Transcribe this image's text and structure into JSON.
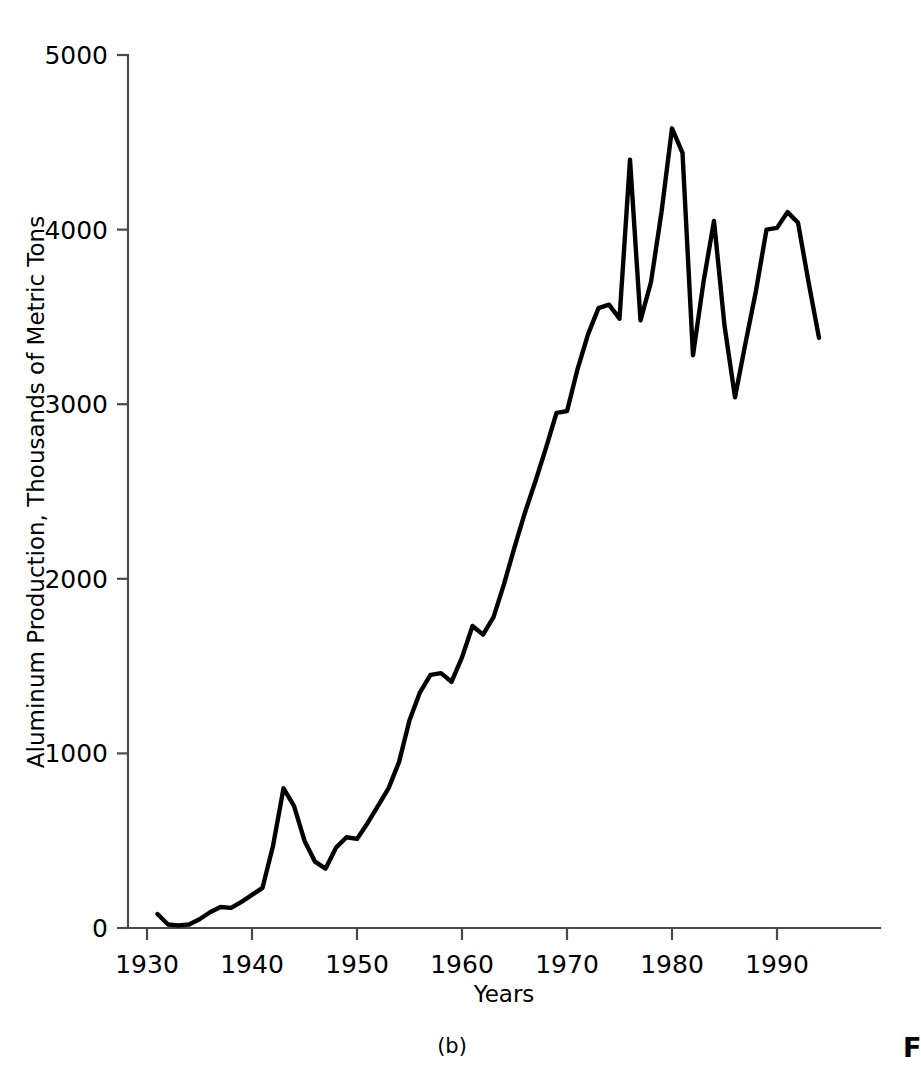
{
  "figure": {
    "panel_label": "(b)",
    "caption_partial": "F"
  },
  "chart_data": {
    "type": "line",
    "title": "",
    "xlabel": "Years",
    "ylabel": "Aluminum Production, Thousands of Metric Tons",
    "xlim": [
      1930,
      1999
    ],
    "ylim": [
      0,
      5000
    ],
    "xticks": [
      1930,
      1940,
      1950,
      1960,
      1970,
      1980,
      1990
    ],
    "xtick_labels": [
      "1930",
      "1940",
      "1950",
      "1960",
      "1970",
      "1980",
      "1990"
    ],
    "yticks": [
      0,
      1000,
      2000,
      3000,
      4000,
      5000
    ],
    "ytick_labels": [
      "0",
      "1000",
      "2000",
      "3000",
      "4000",
      "5000"
    ],
    "grid": false,
    "legend": null,
    "line_color": "#000000",
    "axis_color": "#4a4a4a",
    "series": [
      {
        "name": "Aluminum Production",
        "x": [
          1931,
          1932,
          1933,
          1934,
          1935,
          1936,
          1937,
          1938,
          1939,
          1940,
          1941,
          1942,
          1943,
          1944,
          1945,
          1946,
          1947,
          1948,
          1949,
          1950,
          1951,
          1952,
          1953,
          1954,
          1955,
          1956,
          1957,
          1958,
          1959,
          1960,
          1961,
          1962,
          1963,
          1964,
          1965,
          1966,
          1967,
          1968,
          1969,
          1970,
          1971,
          1972,
          1973,
          1974,
          1975,
          1976,
          1977,
          1978,
          1979,
          1980,
          1981,
          1982,
          1983,
          1984,
          1985,
          1986,
          1987,
          1988,
          1989,
          1990,
          1991,
          1992,
          1993,
          1994
        ],
        "values": [
          80,
          20,
          15,
          20,
          50,
          90,
          120,
          115,
          150,
          190,
          230,
          470,
          800,
          700,
          500,
          380,
          340,
          460,
          520,
          510,
          600,
          700,
          800,
          950,
          1190,
          1350,
          1450,
          1460,
          1410,
          1550,
          1730,
          1680,
          1780,
          1970,
          2180,
          2380,
          2560,
          2750,
          2950,
          2960,
          3200,
          3400,
          3550,
          3570,
          3490,
          4400,
          3480,
          3700,
          4100,
          4580,
          4440,
          3280,
          3700,
          4050,
          3450,
          3040,
          3350,
          3650,
          4000,
          4010,
          4100,
          4040,
          3700,
          3380
        ]
      }
    ]
  },
  "plot_geometry": {
    "left": 128,
    "right": 880,
    "top": 55,
    "bottom": 928,
    "px_per_year": 10.5,
    "year_origin": 1930,
    "year_origin_x": 147
  }
}
